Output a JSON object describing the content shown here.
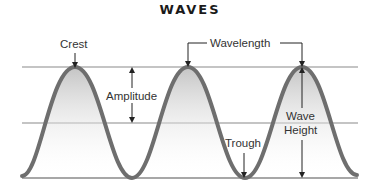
{
  "title": "WAVES",
  "labels": {
    "crest": "Crest",
    "wavelength": "Wavelength",
    "amplitude": "Amplitude",
    "trough": "Trough",
    "wave_height_line1": "Wave",
    "wave_height_line2": "Height"
  },
  "colors": {
    "wave_stroke": "#6e6e6e",
    "reference_lines": "#8a8a8a",
    "fill_top": "#c8c8c8",
    "fill_bottom": "#ffffff",
    "text": "#333333"
  }
}
